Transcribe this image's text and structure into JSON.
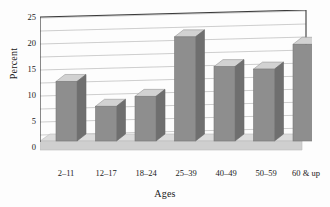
{
  "chart_data": {
    "type": "bar",
    "title": "",
    "subtitle": "",
    "xlabel": "Ages",
    "ylabel": "Percent",
    "categories": [
      "2–11",
      "12–17",
      "18–24",
      "25–39",
      "40–49",
      "50–59",
      "60 & up"
    ],
    "values": [
      12,
      7,
      9,
      21,
      15,
      14.5,
      19.5
    ],
    "ylim": [
      0,
      25
    ],
    "yticks": [
      0,
      5,
      10,
      15,
      20,
      25
    ],
    "ytick_labels": [
      "0",
      "5",
      "10",
      "15",
      "20",
      "25"
    ],
    "minor_gridline_step": 2.5,
    "grid": true,
    "grid_axis": "y",
    "legend": "none",
    "style": "3d-bar",
    "colors": {
      "bar_front": "#8e8e8e",
      "bar_top": "#d2d2d2",
      "bar_side": "#6f6f6f",
      "floor": "#cfcfcf",
      "floor_top": "#dcdcdc",
      "grid": "#b9b9b9",
      "axis": "#3a3a3a",
      "background": "#fdfdfd",
      "text": "#1a1a1a"
    }
  }
}
